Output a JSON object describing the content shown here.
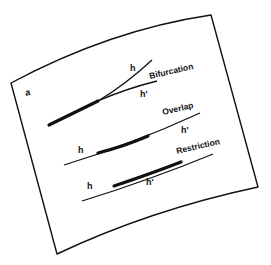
{
  "sheet": {
    "corner_label": "a",
    "colors": {
      "background": "#ffffff",
      "ink": "#111111"
    }
  },
  "panels": [
    {
      "title": "Bifurcation",
      "line_labels": [
        "h",
        "h'"
      ]
    },
    {
      "title": "Overlap",
      "line_labels": [
        "h",
        "h'"
      ]
    },
    {
      "title": "Restriction",
      "line_labels": [
        "h",
        "h'"
      ]
    }
  ]
}
